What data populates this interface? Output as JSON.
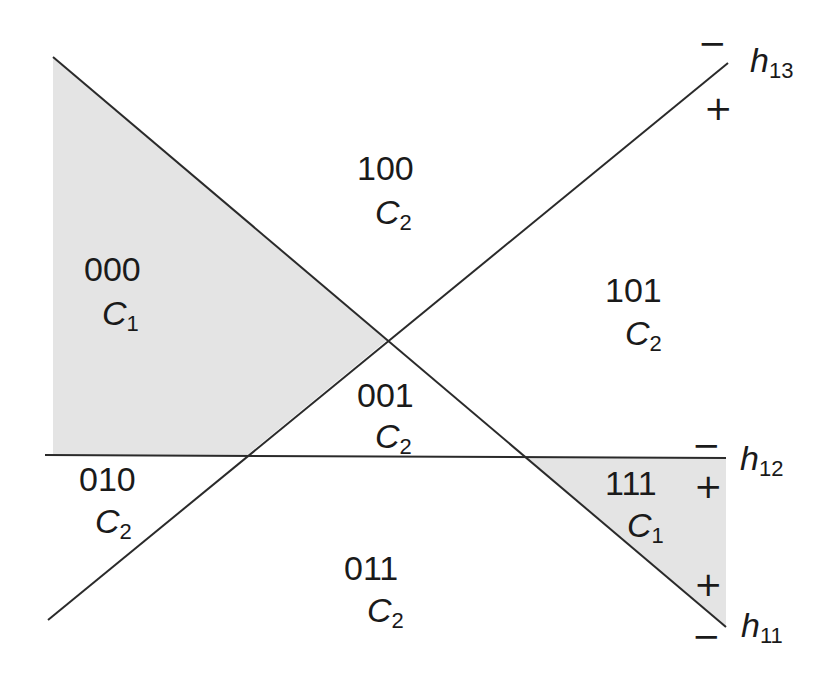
{
  "colors": {
    "line": "#2a2a2a",
    "shade": "#e4e4e4",
    "background": "#ffffff"
  },
  "hyperplanes": [
    {
      "name": "h11",
      "base": "h",
      "sub": "11",
      "from": [
        53,
        57
      ],
      "to": [
        726,
        627
      ],
      "minus_sign": "−",
      "plus_sign": "+"
    },
    {
      "name": "h12",
      "base": "h",
      "sub": "12",
      "from": [
        45,
        455
      ],
      "to": [
        726,
        458
      ],
      "minus_sign": "−",
      "plus_sign": "+"
    },
    {
      "name": "h13",
      "base": "h",
      "sub": "13",
      "from": [
        48,
        620
      ],
      "to": [
        728,
        63
      ],
      "minus_sign": "−",
      "plus_sign": "+"
    }
  ],
  "regions": [
    {
      "code": "000",
      "class_base": "C",
      "class_sub": "1",
      "shaded": true
    },
    {
      "code": "100",
      "class_base": "C",
      "class_sub": "2",
      "shaded": false
    },
    {
      "code": "101",
      "class_base": "C",
      "class_sub": "2",
      "shaded": false
    },
    {
      "code": "001",
      "class_base": "C",
      "class_sub": "2",
      "shaded": false
    },
    {
      "code": "010",
      "class_base": "C",
      "class_sub": "2",
      "shaded": false
    },
    {
      "code": "011",
      "class_base": "C",
      "class_sub": "2",
      "shaded": false
    },
    {
      "code": "111",
      "class_base": "C",
      "class_sub": "1",
      "shaded": true
    }
  ]
}
